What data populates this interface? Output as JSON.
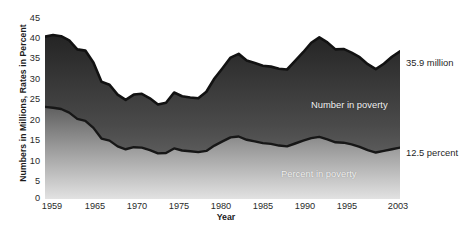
{
  "chart_data": {
    "type": "area",
    "title": "",
    "xlabel": "Year",
    "ylabel": "Numbers in Millions, Rates in Percent",
    "xlim": [
      1959,
      2003
    ],
    "ylim": [
      0,
      45
    ],
    "yticks": [
      45,
      40,
      35,
      30,
      25,
      20,
      15,
      10,
      5,
      0
    ],
    "xticks": [
      1959,
      1965,
      1970,
      1975,
      1980,
      1985,
      1990,
      1995,
      2003
    ],
    "grid": false,
    "legend": "in-plot labels",
    "series": [
      {
        "name": "Number in poverty",
        "unit": "millions",
        "label_in_plot": "Number in poverty",
        "end_annotation": "35.9 million",
        "x": [
          1959,
          1960,
          1961,
          1962,
          1963,
          1964,
          1965,
          1966,
          1967,
          1968,
          1969,
          1970,
          1971,
          1972,
          1973,
          1974,
          1975,
          1976,
          1977,
          1978,
          1979,
          1980,
          1981,
          1982,
          1983,
          1984,
          1985,
          1986,
          1987,
          1988,
          1989,
          1990,
          1991,
          1992,
          1993,
          1994,
          1995,
          1996,
          1997,
          1998,
          1999,
          2000,
          2001,
          2002,
          2003
        ],
        "values": [
          39.5,
          39.9,
          39.6,
          38.6,
          36.4,
          36.1,
          33.2,
          28.5,
          27.8,
          25.4,
          24.1,
          25.4,
          25.6,
          24.5,
          23.0,
          23.4,
          25.9,
          25.0,
          24.7,
          24.5,
          26.1,
          29.3,
          31.8,
          34.4,
          35.3,
          33.7,
          33.1,
          32.4,
          32.2,
          31.7,
          31.5,
          33.6,
          35.7,
          38.0,
          39.3,
          38.1,
          36.4,
          36.5,
          35.6,
          34.5,
          32.8,
          31.6,
          32.9,
          34.6,
          35.9
        ]
      },
      {
        "name": "Percent in poverty",
        "unit": "percent",
        "label_in_plot": "Percent in poverty",
        "end_annotation": "12.5 percent",
        "x": [
          1959,
          1960,
          1961,
          1962,
          1963,
          1964,
          1965,
          1966,
          1967,
          1968,
          1969,
          1970,
          1971,
          1972,
          1973,
          1974,
          1975,
          1976,
          1977,
          1978,
          1979,
          1980,
          1981,
          1982,
          1983,
          1984,
          1985,
          1986,
          1987,
          1988,
          1989,
          1990,
          1991,
          1992,
          1993,
          1994,
          1995,
          1996,
          1997,
          1998,
          1999,
          2000,
          2001,
          2002,
          2003
        ],
        "values": [
          22.4,
          22.2,
          21.9,
          21.0,
          19.5,
          19.0,
          17.3,
          14.7,
          14.2,
          12.8,
          12.1,
          12.6,
          12.5,
          11.9,
          11.1,
          11.2,
          12.3,
          11.8,
          11.6,
          11.4,
          11.7,
          13.0,
          14.0,
          15.0,
          15.2,
          14.4,
          14.0,
          13.6,
          13.4,
          13.0,
          12.8,
          13.5,
          14.2,
          14.8,
          15.1,
          14.5,
          13.8,
          13.7,
          13.3,
          12.7,
          11.9,
          11.3,
          11.7,
          12.1,
          12.5
        ]
      }
    ],
    "colors": {
      "number_area_top": "#2b2b2b",
      "number_area_bottom": "#6e6e6e",
      "percent_area_top": "#6a6a6a",
      "percent_area_bottom": "#d8d8d8",
      "series_line": "#121212",
      "text": "#1f1f1f",
      "in_plot_text": "#f2f2f2",
      "background": "#ffffff"
    }
  },
  "axes": {
    "y_title": "Numbers in Millions, Rates in Percent",
    "x_title": "Year",
    "y_tick_labels": [
      "45",
      "40",
      "35",
      "30",
      "25",
      "20",
      "15",
      "10",
      "5",
      "0"
    ],
    "x_tick_labels": [
      "1959",
      "1965",
      "1970",
      "1975",
      "1980",
      "1985",
      "1990",
      "1995",
      "2003"
    ]
  },
  "annotations": {
    "number_in_plot": "Number in poverty",
    "percent_in_plot": "Percent in poverty",
    "number_callout": "35.9 million",
    "percent_callout": "12.5 percent"
  },
  "caption": {
    "text": ""
  }
}
